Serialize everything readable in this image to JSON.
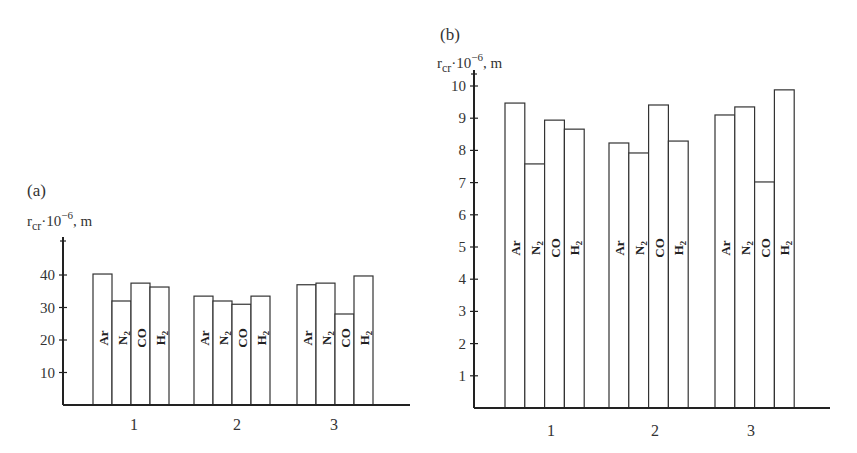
{
  "chart_data": [
    {
      "type": "bar",
      "panel": "(a)",
      "title": "",
      "ylabel": "r_cr·10^-6, m",
      "ylabel_display": {
        "base": "r",
        "sub": "cr",
        "mid": "·10",
        "sup": "−6",
        "tail": ", m"
      },
      "xlabel": "",
      "categories": [
        "1",
        "2",
        "3"
      ],
      "yticks": [
        10,
        20,
        30,
        40
      ],
      "ylim": [
        0,
        50
      ],
      "grid": false,
      "legend": "none (series labels drawn inside bars)",
      "series": [
        {
          "name": "Ar",
          "label_main": "Ar",
          "label_sub": "",
          "values": [
            40.3,
            33.5,
            37.0
          ]
        },
        {
          "name": "N2",
          "label_main": "N",
          "label_sub": "2",
          "values": [
            32.0,
            32.0,
            37.5
          ]
        },
        {
          "name": "CO",
          "label_main": "CO",
          "label_sub": "",
          "values": [
            37.5,
            31.0,
            28.0
          ]
        },
        {
          "name": "H2",
          "label_main": "H",
          "label_sub": "2",
          "values": [
            36.3,
            33.5,
            39.7
          ]
        }
      ]
    },
    {
      "type": "bar",
      "panel": "(b)",
      "title": "",
      "ylabel": "r_cr·10^-6, m",
      "ylabel_display": {
        "base": "r",
        "sub": "cr",
        "mid": "·10",
        "sup": "−6",
        "tail": ", m"
      },
      "xlabel": "",
      "categories": [
        "1",
        "2",
        "3"
      ],
      "yticks": [
        1,
        2,
        3,
        4,
        5,
        6,
        7,
        8,
        9,
        10
      ],
      "ylim": [
        0,
        10
      ],
      "grid": false,
      "legend": "none (series labels drawn inside bars)",
      "series": [
        {
          "name": "Ar",
          "label_main": "Ar",
          "label_sub": "",
          "values": [
            9.47,
            8.23,
            9.1
          ]
        },
        {
          "name": "N2",
          "label_main": "N",
          "label_sub": "2",
          "values": [
            7.58,
            7.92,
            9.35
          ]
        },
        {
          "name": "CO",
          "label_main": "CO",
          "label_sub": "",
          "values": [
            8.94,
            9.41,
            7.02
          ]
        },
        {
          "name": "H2",
          "label_main": "H",
          "label_sub": "2",
          "values": [
            8.66,
            8.29,
            9.88
          ]
        }
      ]
    }
  ]
}
